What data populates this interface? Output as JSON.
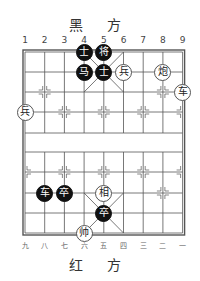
{
  "header": {
    "title": "黑 方"
  },
  "footer": {
    "title": "红 方"
  },
  "top_files": [
    "1",
    "2",
    "3",
    "4",
    "5",
    "6",
    "7",
    "8",
    "9"
  ],
  "bottom_files": [
    "九",
    "八",
    "七",
    "六",
    "五",
    "四",
    "三",
    "二",
    "一"
  ],
  "board": {
    "columns": 9,
    "rows": 10,
    "line_color": "#555555",
    "black_piece_color": "#111111",
    "red_piece_color": "#ffffff"
  },
  "pieces": [
    {
      "side": "black",
      "char": "士",
      "col": 4,
      "row": 0
    },
    {
      "side": "black",
      "char": "将",
      "col": 5,
      "row": 0
    },
    {
      "side": "black",
      "char": "马",
      "col": 4,
      "row": 1
    },
    {
      "side": "black",
      "char": "士",
      "col": 5,
      "row": 1
    },
    {
      "side": "red",
      "char": "兵",
      "col": 6,
      "row": 1
    },
    {
      "side": "red",
      "char": "炮",
      "col": 8,
      "row": 1
    },
    {
      "side": "red",
      "char": "车",
      "col": 9,
      "row": 2
    },
    {
      "side": "red",
      "char": "兵",
      "col": 1,
      "row": 3
    },
    {
      "side": "black",
      "char": "车",
      "col": 2,
      "row": 7
    },
    {
      "side": "black",
      "char": "卒",
      "col": 3,
      "row": 7
    },
    {
      "side": "red",
      "char": "相",
      "col": 5,
      "row": 7
    },
    {
      "side": "black",
      "char": "卒",
      "col": 5,
      "row": 8
    },
    {
      "side": "red",
      "char": "帅",
      "col": 4,
      "row": 9
    }
  ]
}
